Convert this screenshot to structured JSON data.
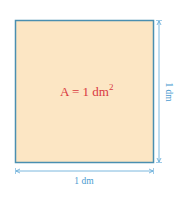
{
  "figure": {
    "area_label_prefix": "A = 1 dm",
    "area_label_exponent": "2",
    "width_label": "1 dm",
    "height_label": "1 dm",
    "colors": {
      "fill": "#fce6c4",
      "border": "#4a8fb0",
      "dimension": "#5aa6d6",
      "area_text": "#d9383f",
      "dimension_text": "#4a9bd0"
    }
  }
}
